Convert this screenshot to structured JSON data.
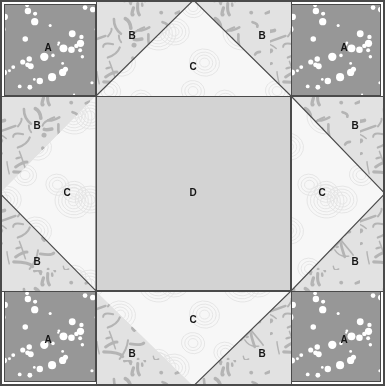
{
  "diagram": {
    "width": 385,
    "height": 386,
    "grid": {
      "columns": 3,
      "rows": 3,
      "x_lines": [
        96,
        291
      ],
      "y_lines": [
        96,
        291
      ],
      "border_color": "#4a4a4a",
      "line_color": "#4a4a4a"
    },
    "fabrics": [
      {
        "key": "A",
        "label": "A",
        "description": "medium gray with white polka dots",
        "base_color": "#979797",
        "accent_color": "#ffffff"
      },
      {
        "key": "B",
        "label": "B",
        "description": "light gray with darker squiggle brush marks",
        "base_color": "#e2e2e2",
        "accent_color": "#b4b4b4"
      },
      {
        "key": "C",
        "label": "C",
        "description": "near white with faint concentric swirl ripples",
        "base_color": "#f7f7f7",
        "accent_color": "#e3e3e3"
      },
      {
        "key": "D",
        "label": "D",
        "description": "solid light medium gray center square",
        "base_color": "#d3d3d3",
        "accent_color": "#cbcbcb"
      }
    ],
    "cells": [
      {
        "name": "corner-top-left",
        "row": 0,
        "col": 0,
        "unit": "square",
        "fabric": "A"
      },
      {
        "name": "edge-top",
        "row": 0,
        "col": 1,
        "unit": "flying-geese",
        "fabric": "C",
        "corner_fabric": "B",
        "point": "up"
      },
      {
        "name": "corner-top-right",
        "row": 0,
        "col": 2,
        "unit": "square",
        "fabric": "A"
      },
      {
        "name": "edge-left",
        "row": 1,
        "col": 0,
        "unit": "flying-geese",
        "fabric": "C",
        "corner_fabric": "B",
        "point": "left"
      },
      {
        "name": "center",
        "row": 1,
        "col": 1,
        "unit": "square",
        "fabric": "D"
      },
      {
        "name": "edge-right",
        "row": 1,
        "col": 2,
        "unit": "flying-geese",
        "fabric": "C",
        "corner_fabric": "B",
        "point": "right"
      },
      {
        "name": "corner-bottom-left",
        "row": 2,
        "col": 0,
        "unit": "square",
        "fabric": "A"
      },
      {
        "name": "edge-bottom",
        "row": 2,
        "col": 1,
        "unit": "flying-geese",
        "fabric": "C",
        "corner_fabric": "B",
        "point": "down"
      },
      {
        "name": "corner-bottom-right",
        "row": 2,
        "col": 2,
        "unit": "square",
        "fabric": "A"
      }
    ],
    "labels": [
      {
        "text": "A",
        "x": 48,
        "y": 48
      },
      {
        "text": "B",
        "x": 132,
        "y": 36
      },
      {
        "text": "C",
        "x": 193,
        "y": 67
      },
      {
        "text": "B",
        "x": 262,
        "y": 36
      },
      {
        "text": "A",
        "x": 344,
        "y": 48
      },
      {
        "text": "B",
        "x": 37,
        "y": 126
      },
      {
        "text": "B",
        "x": 355,
        "y": 126
      },
      {
        "text": "C",
        "x": 67,
        "y": 193
      },
      {
        "text": "D",
        "x": 193,
        "y": 193
      },
      {
        "text": "C",
        "x": 322,
        "y": 193
      },
      {
        "text": "B",
        "x": 37,
        "y": 262
      },
      {
        "text": "B",
        "x": 355,
        "y": 262
      },
      {
        "text": "A",
        "x": 48,
        "y": 340
      },
      {
        "text": "B",
        "x": 132,
        "y": 354
      },
      {
        "text": "C",
        "x": 193,
        "y": 320
      },
      {
        "text": "B",
        "x": 262,
        "y": 354
      },
      {
        "text": "A",
        "x": 344,
        "y": 340
      }
    ]
  }
}
